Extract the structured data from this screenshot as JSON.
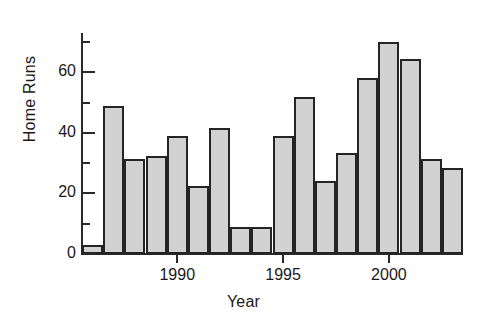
{
  "chart_data": {
    "type": "bar",
    "title": "",
    "xlabel": "Year",
    "ylabel": "Home Runs",
    "categories": [
      1986,
      1987,
      1988,
      1989,
      1990,
      1991,
      1992,
      1993,
      1994,
      1995,
      1996,
      1997,
      1998,
      1999,
      2000,
      2001,
      2002,
      2003
    ],
    "values": [
      3,
      49,
      31.5,
      32.5,
      39,
      22.5,
      41.5,
      9,
      9,
      39,
      52,
      24,
      33.5,
      58,
      70,
      64.5,
      31.5,
      28.5
    ],
    "xlim": [
      1985.5,
      2003.5
    ],
    "ylim": [
      0,
      73
    ],
    "x_tick_values": [
      1990,
      1995,
      2000
    ],
    "x_tick_labels": [
      "1990",
      "1995",
      "2000"
    ],
    "y_tick_values": [
      0,
      20,
      40,
      60
    ],
    "y_tick_labels": [
      "0",
      "20",
      "40",
      "60"
    ],
    "y_minor_tick_values": [
      10,
      30,
      50,
      70
    ],
    "grid": false,
    "legend": false,
    "bar_fill_color": "#d2d2d2",
    "bar_edge_color": "#242424",
    "axis_color": "#2a2a2a",
    "background_color": "#ffffff"
  }
}
